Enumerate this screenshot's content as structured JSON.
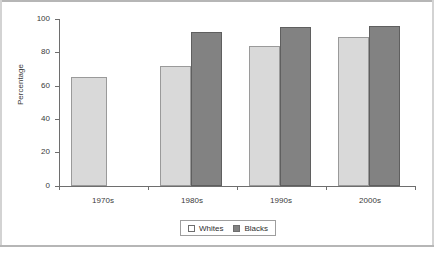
{
  "chart_data": {
    "type": "bar",
    "title": "",
    "xlabel": "",
    "ylabel": "Percentage",
    "ylim": [
      0,
      100
    ],
    "yticks": [
      0,
      20,
      40,
      60,
      80,
      100
    ],
    "ytick_labels": [
      "0",
      "20",
      "40",
      "60",
      "80",
      "100"
    ],
    "grid": false,
    "legend_position": "bottom-center",
    "categories": [
      "1970s",
      "1980s",
      "1990s",
      "2000s"
    ],
    "series": [
      {
        "name": "Whites",
        "color": "#d9d9d9",
        "values": [
          65,
          72,
          84,
          89
        ]
      },
      {
        "name": "Blacks",
        "color": "#828282",
        "values": [
          null,
          92,
          95,
          96
        ]
      }
    ]
  },
  "legend": {
    "items": [
      {
        "label": "Whites",
        "swatch": "whites"
      },
      {
        "label": "Blacks",
        "swatch": "blacks"
      }
    ]
  },
  "colors": {
    "whites_fill": "#d9d9d9",
    "blacks_fill": "#828282",
    "axis": "#6e6e6e",
    "frame_rule": "#b6b6b6",
    "text": "#3a3a3a"
  }
}
